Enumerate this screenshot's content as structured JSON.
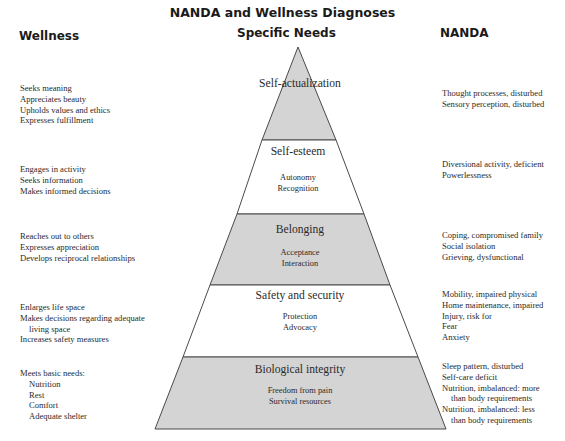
{
  "title": "NANDA and Wellness Diagnoses",
  "columns": {
    "wellness": "Wellness",
    "specific_needs": "Specific Needs",
    "nanda": "NANDA"
  },
  "colors": {
    "shaded_band": "#d4d4d4",
    "white_band": "#ffffff",
    "outline": "#4a4a4a",
    "text": "#2a2a2a"
  },
  "levels": [
    {
      "name": "Self-actualization",
      "needs": [],
      "shaded": true,
      "wellness": [
        "Seeks meaning",
        "Appreciates beauty",
        "Upholds values and ethics",
        "Expresses fulfillment"
      ],
      "nanda": [
        "Thought processes, disturbed",
        "Sensory perception, disturbed"
      ]
    },
    {
      "name": "Self-esteem",
      "needs": [
        "Autonomy",
        "Recognition"
      ],
      "shaded": false,
      "wellness": [
        "Engages in activity",
        "Seeks information",
        "Makes informed decisions"
      ],
      "nanda": [
        "Diversional activity, deficient",
        "Powerlessness"
      ]
    },
    {
      "name": "Belonging",
      "needs": [
        "Acceptance",
        "Interaction"
      ],
      "shaded": true,
      "wellness": [
        "Reaches out to others",
        "Expresses appreciation",
        "Develops reciprocal relationships"
      ],
      "nanda": [
        "Coping, compromised family",
        "Social isolation",
        "Grieving, dysfunctional"
      ]
    },
    {
      "name": "Safety and security",
      "needs": [
        "Protection",
        "Advocacy"
      ],
      "shaded": false,
      "wellness": [
        "Enlarges life space",
        "Makes decisions regarding adequate",
        "living space",
        "Increases safety measures"
      ],
      "nanda": [
        "Mobility, impaired physical",
        "Home maintenance, impaired",
        "Injury, risk for",
        "Fear",
        "Anxiety"
      ]
    },
    {
      "name": "Biological integrity",
      "needs": [
        "Freedom from pain",
        "Survival resources"
      ],
      "shaded": true,
      "wellness": [
        "Meets basic needs:",
        "Nutrition",
        "Rest",
        "Comfort",
        "Adequate shelter"
      ],
      "nanda": [
        "Sleep pattern, disturbed",
        "Self-care deficit",
        "Nutrition, imbalanced: more",
        "than body requirements",
        "Nutrition, imbalanced: less",
        "than body requirements"
      ]
    }
  ]
}
